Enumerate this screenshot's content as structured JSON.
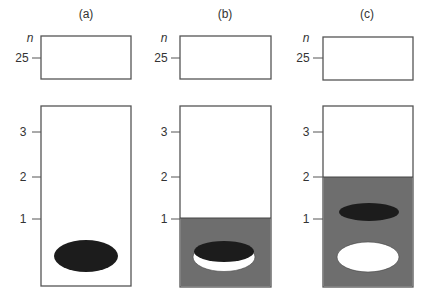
{
  "figure": {
    "panels": [
      {
        "label": "(a)",
        "top_axis_var": "n",
        "top_tick": "25",
        "bottom_ticks": [
          "3",
          "2",
          "1"
        ],
        "fill_level": 0,
        "ellipses": [
          {
            "name": "dark-particle",
            "fill": "#1c1c1c"
          }
        ]
      },
      {
        "label": "(b)",
        "top_axis_var": "n",
        "top_tick": "25",
        "bottom_ticks": [
          "3",
          "2",
          "1"
        ],
        "fill_level": 1,
        "ellipses": [
          {
            "name": "white-particle",
            "fill": "#ffffff"
          },
          {
            "name": "dark-particle",
            "fill": "#1c1c1c"
          }
        ]
      },
      {
        "label": "(c)",
        "top_axis_var": "n",
        "top_tick": "25",
        "bottom_ticks": [
          "3",
          "2",
          "1"
        ],
        "fill_level": 2,
        "ellipses": [
          {
            "name": "dark-particle",
            "fill": "#1c1c1c"
          },
          {
            "name": "white-particle",
            "fill": "#ffffff"
          }
        ]
      }
    ],
    "colors": {
      "medium_fill": "#6e6e6e",
      "dark_particle": "#1c1c1c",
      "light_particle": "#ffffff",
      "outline": "#555555"
    }
  }
}
